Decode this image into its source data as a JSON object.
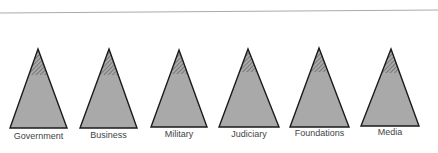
{
  "colors": {
    "fill": "#a9a9a9",
    "stroke": "#1a1a1a",
    "rule": "#aaaaaa",
    "hatch": "#555555"
  },
  "pyramids": [
    {
      "label": "Government",
      "apex_x": 38,
      "apex_y": 49,
      "left": 10,
      "right": 67,
      "base_y": 128,
      "hatch_y": 75,
      "label_y": 131
    },
    {
      "label": "Business",
      "apex_x": 109,
      "apex_y": 49,
      "left": 80,
      "right": 137,
      "base_y": 128,
      "hatch_y": 75,
      "label_y": 130
    },
    {
      "label": "Military",
      "apex_x": 179,
      "apex_y": 50,
      "left": 151,
      "right": 207,
      "base_y": 127,
      "hatch_y": 74,
      "label_y": 129
    },
    {
      "label": "Judiciary",
      "apex_x": 248,
      "apex_y": 49,
      "left": 219,
      "right": 279,
      "base_y": 127,
      "hatch_y": 72,
      "label_y": 129
    },
    {
      "label": "Foundations",
      "apex_x": 319,
      "apex_y": 48,
      "left": 290,
      "right": 349,
      "base_y": 127,
      "hatch_y": 72,
      "label_y": 128
    },
    {
      "label": "Media",
      "apex_x": 391,
      "apex_y": 49,
      "left": 361,
      "right": 419,
      "base_y": 126,
      "hatch_y": 73,
      "label_y": 127
    }
  ]
}
